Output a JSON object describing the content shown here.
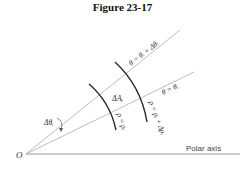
{
  "figure": {
    "title": "Figure 23-17"
  },
  "diagram": {
    "origin_label": "O",
    "polar_axis_label": "Polar axis",
    "ray_inner_label": "θ = θᵢ",
    "ray_outer_label": "θ = θᵢ + Δθᵢ",
    "arc_inner_label": "ρ = ρᵢ",
    "arc_outer_label": "ρ = ρᵢ + Δρᵢ",
    "area_label": "ΔAᵢ",
    "angle_label": "Δθᵢ",
    "colors": {
      "line": "#9a9a9a",
      "arc": "#2a2a2a",
      "text": "#333333"
    }
  }
}
